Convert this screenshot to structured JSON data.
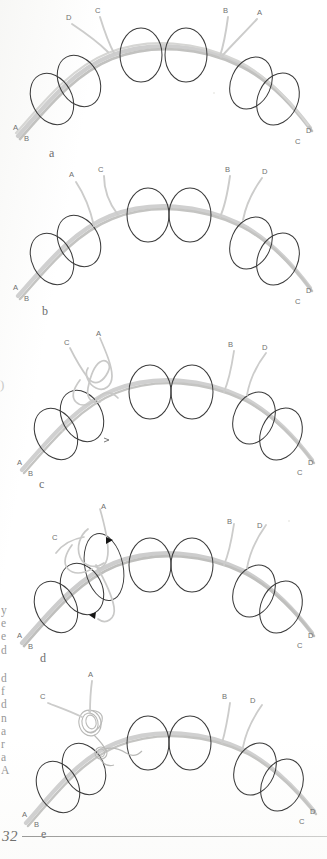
{
  "document": {
    "page_number": "32",
    "type": "scanned-figure-page",
    "figure_count": 5,
    "bleed_through_margin_text": [
      "y",
      "e",
      "e",
      "d",
      "d",
      "f",
      "d",
      "n",
      "a",
      "r",
      "a",
      "A"
    ]
  },
  "colors": {
    "suture_strand": "#c9c9c7",
    "suture_strand_dark": "#a9a9a6",
    "loop_stroke": "#3a3a3a",
    "label_text": "#6d6d6d",
    "arrowhead": "#1a1a1a",
    "paper": "#ffffff",
    "rule": "#9a9a98"
  },
  "panels": [
    {
      "id": "a",
      "caption": "a",
      "labels": {
        "top_left_outer": "D",
        "top_left_inner": "C",
        "top_right_inner": "B",
        "top_right_outer": "A",
        "bottom_left_upper": "A",
        "bottom_left_lower": "B",
        "bottom_right_upper": "D",
        "bottom_right_lower": "C"
      },
      "loop_count": 6,
      "has_knot": false,
      "has_arrowheads": false
    },
    {
      "id": "b",
      "caption": "b",
      "labels": {
        "top_left_outer": "A",
        "top_left_inner": "C",
        "top_right_inner": "B",
        "top_right_outer": "D",
        "bottom_left_upper": "A",
        "bottom_left_lower": "B",
        "bottom_right_upper": "D",
        "bottom_right_lower": "C"
      },
      "loop_count": 6,
      "has_knot": false,
      "has_arrowheads": false
    },
    {
      "id": "c",
      "caption": "c",
      "labels": {
        "top_left_outer": "C",
        "top_left_inner": "A",
        "top_right_inner": "B",
        "top_right_outer": "D",
        "bottom_left_upper": "A",
        "bottom_left_lower": "B",
        "bottom_right_upper": "D",
        "bottom_right_lower": "C"
      },
      "loop_count": 6,
      "has_knot": true,
      "has_arrowheads": false
    },
    {
      "id": "d",
      "caption": "d",
      "labels": {
        "top_left_outer": "C",
        "top_left_inner": "A",
        "top_right_inner": "B",
        "top_right_outer": "D",
        "bottom_left_upper": "A",
        "bottom_left_lower": "B",
        "bottom_right_upper": "D",
        "bottom_right_lower": "C"
      },
      "loop_count": 6,
      "has_knot": true,
      "has_arrowheads": true,
      "arrowhead_count": 2
    },
    {
      "id": "e",
      "caption": "e",
      "labels": {
        "top_left_outer": "C",
        "top_left_inner": "A",
        "top_right_inner": "B",
        "top_right_outer": "D",
        "bottom_left_upper": "A",
        "bottom_left_lower": "B",
        "bottom_right_upper": "D",
        "bottom_right_lower": "C"
      },
      "loop_count": 6,
      "has_knot": true,
      "has_arrowheads": false
    }
  ]
}
